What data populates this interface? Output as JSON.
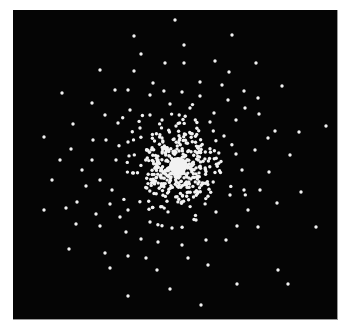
{
  "image": {
    "title": "",
    "description": "Black square field with a radially concentrated cloud of white dots forming a bright, saturated core (globular-cluster-like point distribution)",
    "background_color": "#050505",
    "dot_color": "#f2f2f2",
    "frame_border_color": "#9a9a9a",
    "panel": {
      "x": 13,
      "y": 10,
      "width": 324,
      "height": 309
    },
    "core_center": {
      "x": 178,
      "y": 166
    },
    "dot_radius": 1.7
  },
  "outer_dots": [
    [
      175,
      20
    ],
    [
      134,
      36
    ],
    [
      232,
      35
    ],
    [
      184,
      45
    ],
    [
      141,
      54
    ],
    [
      165,
      63
    ],
    [
      184,
      63
    ],
    [
      215,
      61
    ],
    [
      100,
      70
    ],
    [
      134,
      71
    ],
    [
      256,
      63
    ],
    [
      229,
      72
    ],
    [
      62,
      93
    ],
    [
      115,
      90
    ],
    [
      282,
      86
    ],
    [
      92,
      103
    ],
    [
      258,
      98
    ],
    [
      44,
      137
    ],
    [
      326,
      126
    ],
    [
      299,
      132
    ],
    [
      71,
      149
    ],
    [
      275,
      131
    ],
    [
      52,
      180
    ],
    [
      44,
      210
    ],
    [
      69,
      249
    ],
    [
      76,
      224
    ],
    [
      77,
      202
    ],
    [
      100,
      180
    ],
    [
      93,
      140
    ],
    [
      73,
      124
    ],
    [
      105,
      115
    ],
    [
      128,
      90
    ],
    [
      153,
      83
    ],
    [
      200,
      82
    ],
    [
      244,
      91
    ],
    [
      245,
      108
    ],
    [
      259,
      114
    ],
    [
      268,
      138
    ],
    [
      290,
      155
    ],
    [
      301,
      192
    ],
    [
      316,
      227
    ],
    [
      277,
      203
    ],
    [
      269,
      172
    ],
    [
      260,
      190
    ],
    [
      248,
      210
    ],
    [
      237,
      226
    ],
    [
      258,
      227
    ],
    [
      288,
      284
    ],
    [
      278,
      270
    ],
    [
      237,
      284
    ],
    [
      208,
      265
    ],
    [
      201,
      305
    ],
    [
      170,
      289
    ],
    [
      157,
      270
    ],
    [
      128,
      296
    ],
    [
      110,
      268
    ],
    [
      128,
      256
    ],
    [
      105,
      253
    ],
    [
      141,
      239
    ],
    [
      158,
      242
    ],
    [
      182,
      245
    ],
    [
      120,
      217
    ],
    [
      100,
      226
    ],
    [
      110,
      204
    ],
    [
      60,
      160
    ],
    [
      92,
      160
    ],
    [
      86,
      186
    ],
    [
      66,
      208
    ],
    [
      170,
      104
    ],
    [
      190,
      108
    ],
    [
      214,
      113
    ],
    [
      228,
      100
    ],
    [
      150,
      115
    ],
    [
      130,
      110
    ],
    [
      118,
      123
    ],
    [
      200,
      96
    ],
    [
      222,
      85
    ],
    [
      150,
      95
    ],
    [
      182,
      92
    ],
    [
      236,
      120
    ],
    [
      255,
      150
    ],
    [
      242,
      170
    ],
    [
      230,
      195
    ],
    [
      216,
      212
    ],
    [
      196,
      220
    ],
    [
      172,
      228
    ],
    [
      150,
      222
    ],
    [
      128,
      210
    ],
    [
      112,
      190
    ],
    [
      116,
      160
    ],
    [
      128,
      142
    ],
    [
      140,
      128
    ],
    [
      162,
      120
    ],
    [
      210,
      122
    ],
    [
      224,
      136
    ],
    [
      236,
      154
    ],
    [
      244,
      190
    ],
    [
      226,
      240
    ],
    [
      206,
      240
    ],
    [
      188,
      258
    ],
    [
      146,
      258
    ],
    [
      126,
      232
    ],
    [
      96,
      214
    ],
    [
      82,
      170
    ],
    [
      106,
      140
    ]
  ],
  "core_generator": {
    "seed": 20240611,
    "count": 430,
    "scale_px": 38,
    "distribution": "gaussian-radial",
    "max_radius_px": 95
  },
  "chart_data": {
    "type": "scatter",
    "title": "",
    "xlabel": "",
    "ylabel": "",
    "grid": false,
    "legend": "none"
  }
}
